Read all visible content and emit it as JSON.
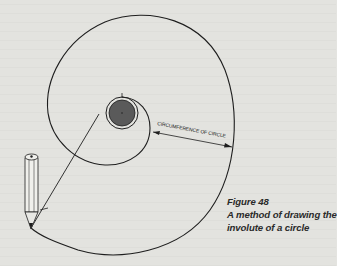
{
  "figure": {
    "number_label": "Figure 48",
    "caption_line1": "A method of drawing the",
    "caption_line2": "involute of a circle"
  },
  "diagram": {
    "dimension_label": "CIRCUMFERENCE OF CIRCLE",
    "elements": [
      "involute-spiral",
      "base-circle",
      "string-line",
      "pencil",
      "circumference-arrow"
    ],
    "colors": {
      "ink": "#1e1e1e",
      "base_circle_fill": "#5a5a5a",
      "paper": "#e3e3df"
    }
  }
}
